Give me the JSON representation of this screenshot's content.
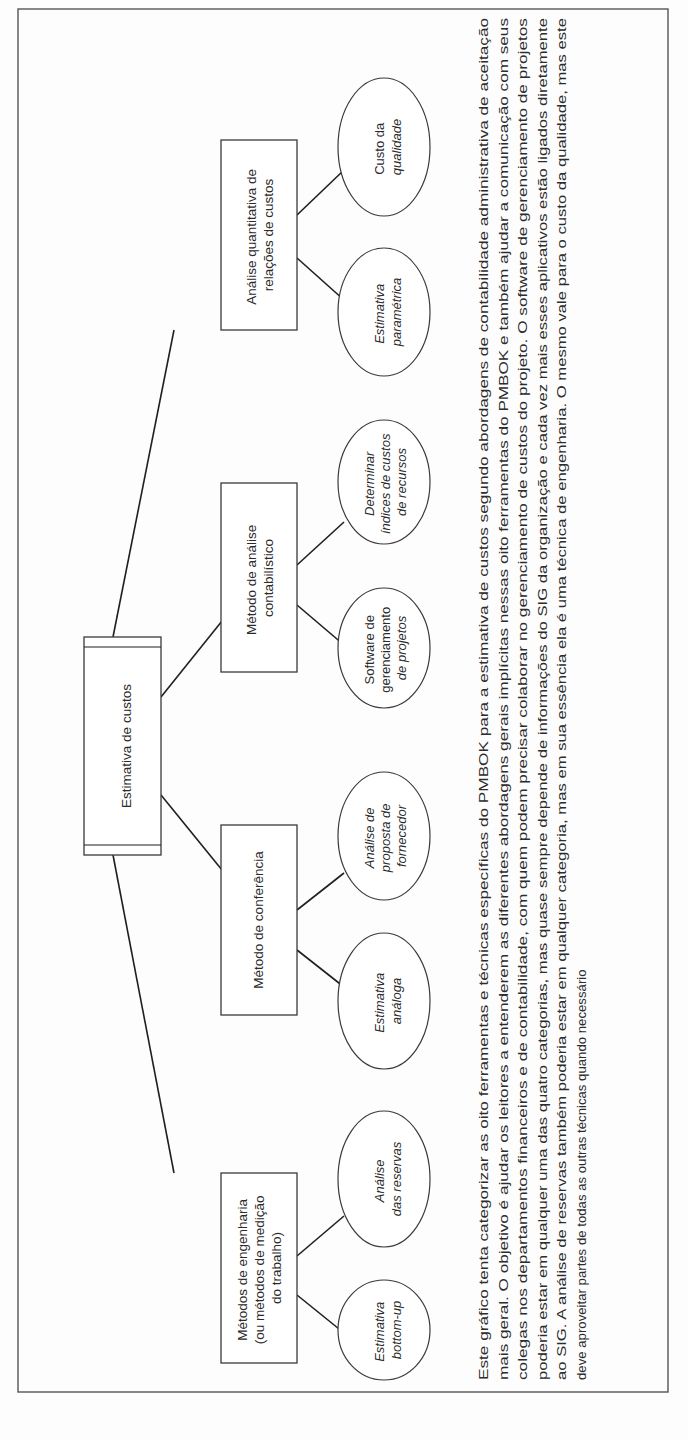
{
  "orientation": "rotated-90-ccw",
  "diagram": {
    "root": {
      "label": "Estimativa de custos"
    },
    "categories": [
      {
        "label_lines": [
          "Análise quantitativa de",
          "relações de custos"
        ],
        "leaves": [
          {
            "label_lines": [
              "Estimativa",
              "paramétrica"
            ],
            "italic": [
              true,
              true
            ]
          },
          {
            "label_lines": [
              "Custo da",
              "qualidade"
            ],
            "italic": [
              true,
              true
            ]
          }
        ]
      },
      {
        "label_lines": [
          "Método de análise",
          "contabilístico"
        ],
        "leaves": [
          {
            "label_lines": [
              "Software de",
              "gerenciamento",
              "de projetos"
            ],
            "italic": [
              false,
              false,
              true
            ]
          },
          {
            "label_lines": [
              "Determinar",
              "índices de custos",
              "de recursos"
            ],
            "italic": [
              true,
              true,
              true
            ]
          }
        ]
      },
      {
        "label_lines": [
          "Método de conferência"
        ],
        "leaves": [
          {
            "label_lines": [
              "Estimativa",
              "análoga"
            ],
            "italic": [
              true,
              true
            ]
          },
          {
            "label_lines": [
              "Análise de",
              "proposta  de",
              "fornecedor"
            ],
            "italic": [
              true,
              true,
              true
            ]
          }
        ]
      },
      {
        "label_lines": [
          "Métodos de engenharia",
          "(ou métodos de medição",
          "do trabalho)"
        ],
        "leaves": [
          {
            "label_lines": [
              "Estimativa",
              "bottom-up"
            ],
            "italic": [
              true,
              true
            ]
          },
          {
            "label_lines": [
              "Análise",
              "das reservas"
            ],
            "italic": [
              true,
              true
            ]
          }
        ]
      }
    ]
  },
  "caption": {
    "lines": [
      "Este gráfico tenta categorizar as oito ferramentas e técnicas específicas do PMBOK para a estimativa de custos segundo abordagens de contabilidade administrativa de aceitação",
      "mais geral. O objetivo é ajudar os leitores a entenderem as diferentes abordagens gerais implícitas nessas oito ferramentas do PMBOK e também ajudar a comunicação com seus",
      "colegas nos departamentos financeiros e de contabilidade, com quem podem precisar colaborar no gerenciamento de custos do projeto. O software de gerenciamento de projetos",
      "poderia estar em qualquer uma das quatro categorias, mas quase sempre depende de informações do SIG da organização e cada vez mais esses aplicativos estão ligados diretamente",
      "ao SIG. A análise de reservas também poderia estar em qualquer categoria, mas em sua essência ela é uma técnica de engenharia. O mesmo vale para o custo da qualidade, mas este",
      "deve aproveitar partes de todas as outras técnicas quando necessário"
    ],
    "italic_word_line3": "software"
  },
  "colors": {
    "line": "#1f1f1f",
    "border": "#555555",
    "text": "#2a2a2a",
    "background": "#fdfdfd"
  }
}
